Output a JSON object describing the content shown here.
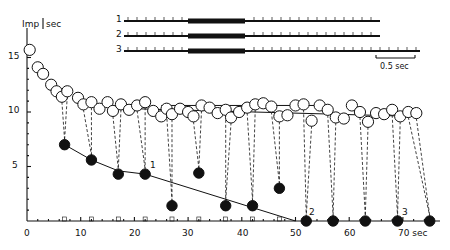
{
  "chart_data": {
    "type": "scatter",
    "title": "",
    "ylabel": "Imp / sec",
    "xlabel": "sec",
    "xlim": [
      0,
      75
    ],
    "ylim": [
      0,
      17
    ],
    "x_ticks": [
      0,
      10,
      20,
      30,
      40,
      50,
      60,
      70
    ],
    "x_tick_labels": [
      "0",
      "10",
      "20",
      "30",
      "40",
      "50",
      "60",
      "70 sec"
    ],
    "y_ticks": [
      5,
      10,
      15
    ],
    "y_tick_labels": [
      "5",
      "10",
      "15"
    ],
    "grid": false,
    "legend": "none",
    "annotations": [
      "1",
      "2",
      "3"
    ],
    "inset_traces": {
      "labels": [
        "1",
        "2",
        "3"
      ],
      "scale_bar": "0.5 sec"
    },
    "series": [
      {
        "name": "open circles (firing rate)",
        "marker": "open-circle",
        "x": [
          0.5,
          2,
          3,
          4.5,
          5.5,
          6.5,
          7.5,
          9.5,
          10.5,
          12,
          13.5,
          15,
          16,
          17.5,
          19,
          20.5,
          22,
          23.5,
          25,
          26,
          27,
          28.5,
          30,
          31,
          32.5,
          34,
          35.5,
          37,
          38,
          39.5,
          41,
          42.5,
          44,
          45.5,
          47,
          48.5,
          50,
          51.5,
          53,
          54.5,
          56,
          57.5,
          59,
          60.5,
          62,
          63.5,
          65,
          66.5,
          68,
          69.5,
          71,
          72.5
        ],
        "y": [
          15.7,
          14.1,
          13.5,
          12.5,
          11.9,
          11.4,
          11.9,
          11.3,
          10.7,
          10.9,
          10.3,
          10.9,
          10.1,
          10.7,
          10.2,
          10.6,
          10.9,
          10.1,
          9.6,
          10.3,
          9.8,
          10.3,
          10.0,
          9.6,
          10.6,
          10.4,
          9.9,
          10.2,
          9.5,
          10.0,
          10.4,
          10.7,
          10.8,
          10.5,
          9.6,
          9.7,
          10.6,
          10.7,
          9.2,
          10.6,
          10.2,
          9.5,
          9.4,
          10.6,
          10.0,
          9.1,
          9.9,
          9.8,
          10.2,
          9.6,
          10.0,
          9.9
        ]
      },
      {
        "name": "filled circles (test responses)",
        "marker": "filled-circle",
        "x": [
          7,
          12,
          17,
          22,
          27,
          32,
          37,
          42,
          47,
          52,
          57,
          63,
          69,
          75
        ],
        "y": [
          7.0,
          5.6,
          4.3,
          4.3,
          1.4,
          4.4,
          1.4,
          1.4,
          3.0,
          0,
          0,
          0,
          0,
          0
        ]
      }
    ],
    "trend_lines": [
      {
        "name": "decline line",
        "x": [
          7,
          12,
          17,
          22,
          50
        ],
        "y": [
          7.0,
          5.6,
          4.6,
          4.3,
          0
        ]
      },
      {
        "name": "upper plateau",
        "x": [
          25,
          55
        ],
        "y": [
          10.6,
          10.6
        ]
      },
      {
        "name": "lower plateau",
        "x": [
          20,
          72
        ],
        "y": [
          10.3,
          9.6
        ]
      }
    ]
  },
  "axis": {
    "ylabel": "Imp",
    "yunit": "sec",
    "xlabels": [
      "0",
      "10",
      "20",
      "30",
      "40",
      "50",
      "60",
      "70 sec"
    ],
    "ylabels": [
      "5",
      "10",
      "15"
    ]
  },
  "annotations": {
    "a1": "1",
    "a2": "2",
    "a3": "3"
  },
  "inset": {
    "trace_labels": [
      "1",
      "2",
      "3"
    ],
    "scale_bar": "0.5 sec"
  }
}
